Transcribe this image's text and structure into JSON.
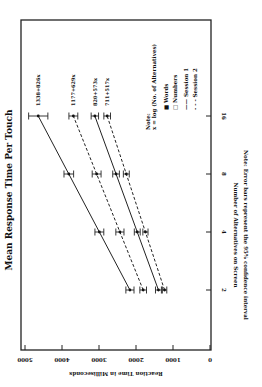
{
  "chart_data": {
    "type": "line",
    "orientation_note": "figure is rotated 90 degrees clockwise in the image",
    "title": "Mean Response Time Per Touch",
    "xlabel": "Number of Alternatives on Screen",
    "ylabel": "Reaction Time in Milliseconds",
    "x": [
      2,
      4,
      8,
      16
    ],
    "x_scale": "log2",
    "ylim": [
      0,
      5000
    ],
    "yticks": [
      0,
      1000,
      2000,
      3000,
      4000,
      5000
    ],
    "ytick_labels": [
      "0",
      "1000",
      "2000",
      "3000",
      "4000",
      "5000"
    ],
    "xtick_labels": [
      "2",
      "4",
      "8",
      "16"
    ],
    "series": [
      {
        "name": "Words - Session 1",
        "marker": "filled-square",
        "line": "solid",
        "fit": "1338+826x",
        "values": [
          2164,
          2990,
          3816,
          4642
        ],
        "ci": [
          110,
          120,
          130,
          260
        ]
      },
      {
        "name": "Words - Session 2",
        "marker": "filled-square",
        "line": "dashed",
        "fit": "1177+629x",
        "values": [
          1806,
          2435,
          3064,
          3693
        ],
        "ci": [
          90,
          110,
          120,
          120
        ]
      },
      {
        "name": "Numbers - Session 1",
        "marker": "open-square",
        "line": "solid",
        "fit": "820+573x",
        "values": [
          1393,
          1966,
          2539,
          3112
        ],
        "ci": [
          80,
          80,
          90,
          100
        ]
      },
      {
        "name": "Numbers - Session 2",
        "marker": "open-square",
        "line": "dashed",
        "fit": "711+517x",
        "values": [
          1228,
          1745,
          2262,
          2779
        ],
        "ci": [
          60,
          70,
          80,
          90
        ]
      }
    ],
    "legend": {
      "note_title": "Note:",
      "note_formula": "x = log (No. of Alternatives)",
      "entries": [
        {
          "symbol": "■",
          "label": "Words"
        },
        {
          "symbol": "□",
          "label": "Numbers"
        },
        {
          "symbol": "——",
          "label": "Session 1"
        },
        {
          "symbol": "- - -",
          "label": "Session 2"
        }
      ]
    },
    "footnote": "Note: Error bars represent the 95% confidence interval",
    "grid": false
  }
}
